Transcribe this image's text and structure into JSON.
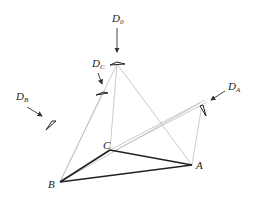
{
  "diagram": {
    "type": "geometric-projection",
    "points": [
      {
        "id": "A",
        "label": "A",
        "x": 192,
        "y": 165
      },
      {
        "id": "B",
        "label": "B",
        "x": 60,
        "y": 182
      },
      {
        "id": "C",
        "label": "C",
        "x": 110,
        "y": 150
      }
    ],
    "directions": [
      {
        "id": "D0",
        "main": "D",
        "sub": "0"
      },
      {
        "id": "DC",
        "main": "D",
        "sub": "C"
      },
      {
        "id": "DB",
        "main": "D",
        "sub": "B"
      },
      {
        "id": "DA",
        "main": "D",
        "sub": "A"
      }
    ],
    "colors": {
      "triangle": "#222222",
      "construction": "#b8b8b8",
      "arrow": "#333333"
    }
  }
}
